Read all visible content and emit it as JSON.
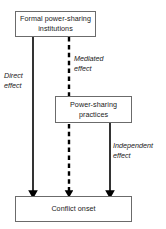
{
  "diagram": {
    "background_color": "#ffffff",
    "box_border_color": "#6b6b6b",
    "arrow_color": "#000000",
    "text_color": "#1a1a1a",
    "nodes": [
      {
        "id": "formal-institutions",
        "label": "Formal power-sharing institutions",
        "x": 15,
        "y": 11,
        "width": 81,
        "height": 26
      },
      {
        "id": "practices",
        "label": "Power-sharing practices",
        "x": 55,
        "y": 96,
        "width": 77,
        "height": 27
      },
      {
        "id": "conflict-onset",
        "label": "Conflict onset",
        "x": 15,
        "y": 196,
        "width": 117,
        "height": 26
      }
    ],
    "edges": [
      {
        "id": "direct-effect",
        "label": "Direct effect",
        "style": "solid",
        "from": "formal-institutions",
        "to": "conflict-onset",
        "x": 33
      },
      {
        "id": "mediated-effect",
        "label": "Mediated effect",
        "style": "dashed",
        "from": "formal-institutions",
        "to": "conflict-onset",
        "x": 69
      },
      {
        "id": "independent-effect",
        "label": "Independent effect",
        "style": "solid",
        "from": "practices",
        "to": "conflict-onset",
        "x": 110
      }
    ]
  }
}
